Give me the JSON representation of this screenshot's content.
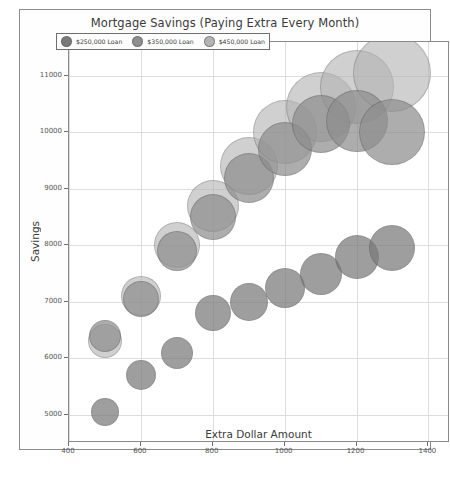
{
  "figure": {
    "title": "Mortgage Savings (Paying Extra Every Month)"
  },
  "legend": {
    "position": "upper-left-inside",
    "items": [
      {
        "label": "$250,000 Loan",
        "color": "#7a7a7a"
      },
      {
        "label": "$350,000 Loan",
        "color": "#8e8e8e"
      },
      {
        "label": "$450,000 Loan",
        "color": "#b4b4b4"
      }
    ]
  },
  "chart_data": {
    "type": "scatter",
    "title": "Mortgage Savings (Paying Extra Every Month)",
    "xlabel": "Extra Dollar Amount",
    "ylabel": "Savings",
    "xlim": [
      400,
      1460
    ],
    "ylim": [
      4500,
      11600
    ],
    "grid": true,
    "xticks": [
      400,
      600,
      800,
      1000,
      1200,
      1400
    ],
    "yticks": [
      5000,
      6000,
      7000,
      8000,
      9000,
      10000,
      11000
    ],
    "legend_position": "upper left",
    "series": [
      {
        "name": "$250,000 Loan",
        "color": "#7a7a7a",
        "opacity": 0.72,
        "x": [
          500,
          600,
          700,
          800,
          900,
          1000,
          1100,
          1200,
          1300
        ],
        "y": [
          5050,
          5700,
          6100,
          6800,
          7000,
          7250,
          7500,
          7800,
          7950
        ],
        "sizes": [
          28,
          30,
          32,
          36,
          38,
          40,
          42,
          44,
          46
        ]
      },
      {
        "name": "$350,000 Loan",
        "color": "#8e8e8e",
        "opacity": 0.72,
        "x": [
          500,
          600,
          700,
          800,
          900,
          1000,
          1100,
          1200,
          1300
        ],
        "y": [
          6400,
          7050,
          7900,
          8500,
          9200,
          9700,
          10150,
          10200,
          10000
        ],
        "sizes": [
          32,
          36,
          40,
          46,
          50,
          54,
          58,
          62,
          66
        ]
      },
      {
        "name": "$450,000 Loan",
        "color": "#b4b4b4",
        "opacity": 0.62,
        "x": [
          500,
          600,
          700,
          800,
          900,
          1000,
          1100,
          1200,
          1300
        ],
        "y": [
          6300,
          7100,
          8000,
          8700,
          9400,
          10000,
          10450,
          10800,
          11050
        ],
        "sizes": [
          34,
          40,
          46,
          52,
          58,
          64,
          70,
          74,
          78
        ]
      }
    ]
  }
}
